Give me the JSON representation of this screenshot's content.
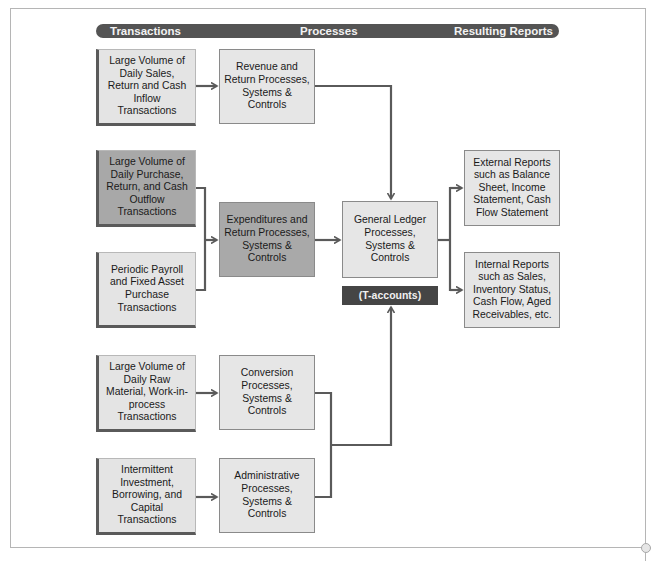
{
  "header": {
    "columns": [
      "Transactions",
      "Processes",
      "Resulting Reports"
    ]
  },
  "transactions": [
    {
      "id": "sales",
      "label": "Large Volume of Daily Sales, Return and Cash Inflow Transactions",
      "shade": "light"
    },
    {
      "id": "purchase",
      "label": "Large Volume of Daily Purchase, Return, and Cash Outflow Transactions",
      "shade": "dark"
    },
    {
      "id": "payroll",
      "label": "Periodic Payroll and Fixed Asset Purchase Transactions",
      "shade": "light"
    },
    {
      "id": "raw-material",
      "label": "Large Volume of Daily Raw Material, Work-in-process Transactions",
      "shade": "light"
    },
    {
      "id": "investment",
      "label": "Intermittent Investment, Borrowing, and Capital Transactions",
      "shade": "light"
    }
  ],
  "processes": [
    {
      "id": "revenue",
      "label": "Revenue and Return Processes, Systems & Controls",
      "shade": "light"
    },
    {
      "id": "expenditures",
      "label": "Expenditures and Return Processes, Systems & Controls",
      "shade": "dark"
    },
    {
      "id": "conversion",
      "label": "Conversion Processes, Systems & Controls",
      "shade": "light"
    },
    {
      "id": "administrative",
      "label": "Administrative Processes, Systems & Controls",
      "shade": "light"
    }
  ],
  "general_ledger": {
    "label": "General Ledger Processes, Systems & Controls",
    "sublabel": "(T-accounts)"
  },
  "reports": [
    {
      "id": "external",
      "label": "External Reports such as Balance Sheet, Income Statement, Cash Flow Statement"
    },
    {
      "id": "internal",
      "label": "Internal Reports such as Sales, Inventory Status, Cash Flow, Aged Receivables, etc."
    }
  ],
  "colors": {
    "header_bar": "#545454",
    "box_light": "#e4e4e4",
    "box_dark": "#a8a8a8",
    "t_accounts": "#454545",
    "connector": "#5a5a5a"
  }
}
